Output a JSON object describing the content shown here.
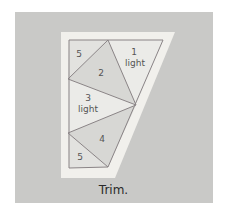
{
  "figure": {
    "caption": "Trim.",
    "colors": {
      "background_panel": "#c9c9c7",
      "paper": "#f1f0ec",
      "sewing_line": "#8a8486",
      "fabric_light": "#ebebe8",
      "fabric_medium": "#d7d7d4"
    },
    "sections": [
      {
        "id": "5",
        "label": "5"
      },
      {
        "id": "1",
        "label": "1",
        "sublabel": "light"
      },
      {
        "id": "2",
        "label": "2"
      },
      {
        "id": "3",
        "label": "3",
        "sublabel": "light"
      },
      {
        "id": "4",
        "label": "4"
      },
      {
        "id": "5b",
        "label": "5"
      }
    ]
  }
}
